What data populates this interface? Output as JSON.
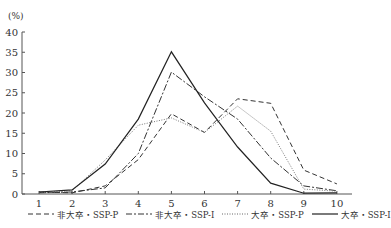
{
  "chart_data": {
    "type": "line",
    "title": "",
    "xlabel": "",
    "ylabel": "(%)",
    "ylim": [
      0,
      40
    ],
    "yticks": [
      0,
      5,
      10,
      15,
      20,
      25,
      30,
      35,
      40
    ],
    "x": [
      1,
      2,
      3,
      4,
      5,
      6,
      7,
      8,
      9,
      10
    ],
    "grid": false,
    "legend_position": "bottom",
    "series": [
      {
        "name": "非大卒・SSP-P",
        "style": "dashed",
        "values": [
          0.5,
          0.3,
          2.0,
          8.5,
          19.8,
          15.2,
          23.5,
          22.4,
          5.9,
          2.5
        ]
      },
      {
        "name": "非大卒・SSP-I",
        "style": "dashdot",
        "values": [
          0.3,
          0.5,
          1.5,
          10.0,
          30.1,
          24.0,
          18.5,
          8.9,
          2.0,
          0.8
        ]
      },
      {
        "name": "大卒・SSP-P",
        "style": "dotted",
        "values": [
          0.3,
          0.8,
          8.4,
          17.0,
          18.8,
          15.2,
          21.7,
          15.5,
          1.2,
          0.7
        ]
      },
      {
        "name": "大卒・SSP-I",
        "style": "solid",
        "values": [
          0.5,
          1.0,
          7.4,
          18.5,
          35.1,
          22.5,
          11.6,
          2.7,
          0.2,
          0.3
        ]
      }
    ]
  },
  "legend": {
    "items": [
      {
        "label": "非大卒・SSP-P"
      },
      {
        "label": "非大卒・SSP-I"
      },
      {
        "label": "大卒・SSP-P"
      },
      {
        "label": "大卒・SSP-I"
      }
    ]
  }
}
